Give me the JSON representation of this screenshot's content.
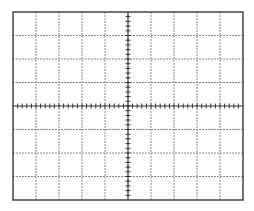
{
  "graticule": {
    "description": "Oscilloscope graticule grid",
    "frame": {
      "left": 13,
      "top": 12,
      "right": 243,
      "bottom": 200
    },
    "divisions": {
      "horizontal": 10,
      "vertical": 8
    },
    "minor_ticks_per_division": 5,
    "colors": {
      "background": "#ffffff",
      "frame": "#444444",
      "grid": "#8a8a8a",
      "axis": "#333333"
    }
  }
}
